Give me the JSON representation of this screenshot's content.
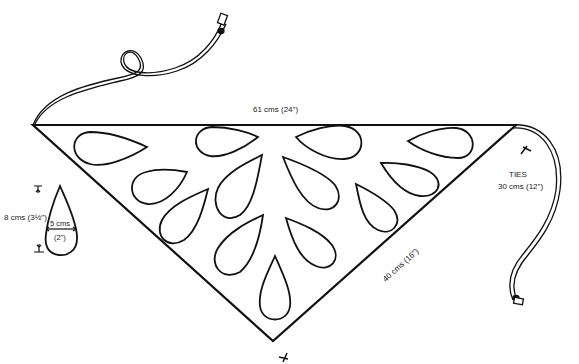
{
  "diagram": {
    "type": "sewing-pattern",
    "labels": {
      "top_edge": "61 cms (24\")",
      "side_edge": "40 cms (16\")",
      "ties_title": "TIES",
      "ties_length": "30 cms (12\")",
      "teardrop_height": "8 cms (3½\")",
      "teardrop_width_cm": "5 cms",
      "teardrop_width_in": "(2\")"
    },
    "colors": {
      "line": "#111111",
      "background": "#ffffff"
    },
    "teardrop_count_in_triangle": 13
  }
}
